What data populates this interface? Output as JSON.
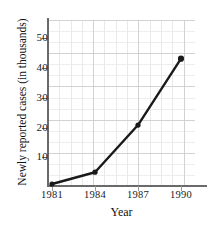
{
  "chart_data": {
    "type": "line",
    "title": "",
    "subtitle": "",
    "xlabel": "Year",
    "ylabel": "Newly reported cases (in thousands)",
    "x": [
      1981,
      1984,
      1987,
      1990
    ],
    "categories": [
      "1981",
      "1984",
      "1987",
      "1990"
    ],
    "values": [
      0.5,
      4.5,
      20.5,
      43
    ],
    "series": [
      {
        "name": "Newly reported cases",
        "values": [
          0.5,
          4.5,
          20.5,
          43
        ]
      }
    ],
    "xticks": [
      "1981",
      "1984",
      "1987",
      "1990"
    ],
    "yticks": [
      "10",
      "20",
      "30",
      "40",
      "50"
    ],
    "ytick_values": [
      10,
      20,
      30,
      40,
      50
    ],
    "xlim": [
      1981,
      1990
    ],
    "ylim": [
      0,
      55
    ],
    "grid": true,
    "legend": "none",
    "line_color": "#1a1a1a",
    "marker": "circle",
    "marker_color": "#1a1a1a",
    "grid_color": "#dcdcdc",
    "axis_color": "#6a6a6a",
    "background": "#ffffff"
  },
  "axis": {
    "y_title": "Newly reported cases (in thousands)",
    "x_title": "Year",
    "y_labels": [
      "50",
      "40",
      "30",
      "20",
      "10"
    ],
    "x_labels": [
      "1981",
      "1984",
      "1987",
      "1990"
    ]
  }
}
